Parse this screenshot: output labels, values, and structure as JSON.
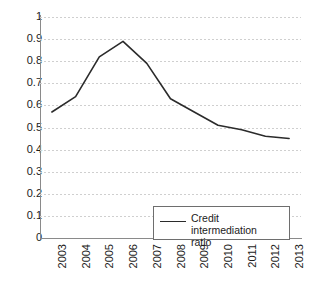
{
  "chart_data": {
    "type": "line",
    "title": "",
    "xlabel": "",
    "ylabel": "",
    "categories": [
      "2003",
      "2004",
      "2005",
      "2006",
      "2007",
      "2008",
      "2009",
      "2010",
      "2011",
      "2012",
      "2013"
    ],
    "series": [
      {
        "name": "Credit intermediation ratio",
        "values": [
          0.57,
          0.64,
          0.82,
          0.89,
          0.79,
          0.63,
          0.57,
          0.51,
          0.49,
          0.46,
          0.45
        ]
      }
    ],
    "ylim": [
      0,
      1
    ],
    "ytick_labels": [
      "1",
      "0.9",
      "0.8",
      "0.7",
      "0.6",
      "0.5",
      "0.4",
      "0.3",
      "0.2",
      "0.1",
      "0"
    ],
    "ytick_values": [
      1,
      0.9,
      0.8,
      0.7,
      0.6,
      0.5,
      0.4,
      0.3,
      0.2,
      0.1,
      0
    ],
    "grid": true,
    "grid_axis": "y",
    "grid_style": "dotted",
    "legend_position": "inside-bottom-right",
    "line_color": "#2b2b2b",
    "grid_color": "#cfcfcf",
    "axis_color": "#8a8a8a",
    "background_color": "#ffffff",
    "xtick_rotation": "90"
  },
  "legend": {
    "entries": [
      {
        "label_line1": "Credit intermediation",
        "label_line2": "ratio",
        "marker": "line-swatch"
      }
    ]
  }
}
